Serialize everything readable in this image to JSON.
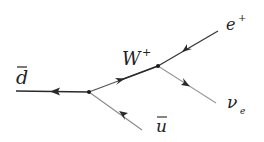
{
  "diagram": {
    "type": "feynman",
    "particles": {
      "d_bar": {
        "label": "d",
        "overbar": true
      },
      "u_bar": {
        "label": "u",
        "overbar": true
      },
      "w_boson": {
        "label": "W",
        "charge": "+"
      },
      "positron": {
        "label": "e",
        "charge": "+"
      },
      "neutrino": {
        "label": "ν",
        "subscript": "e"
      }
    },
    "colors": {
      "line": "#3a3a3a",
      "faint_line": "#9a9a9a",
      "text": "#222222"
    }
  }
}
